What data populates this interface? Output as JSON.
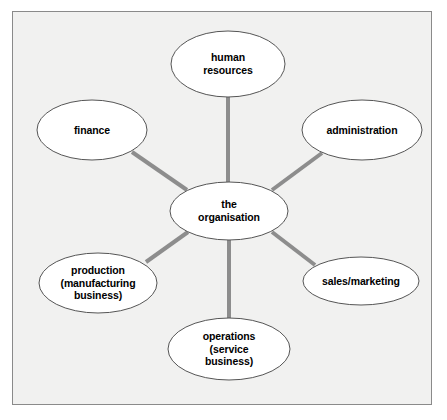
{
  "diagram": {
    "type": "hub-and-spoke concept map",
    "frame": {
      "background_color": "#f1f1f0",
      "border_color": "#8a8a8a"
    },
    "style": {
      "node_fill": "#ffffff",
      "node_stroke": "#555555",
      "connector_color": "#8d8d8d",
      "text_color": "#000000"
    },
    "center": {
      "id": "the-organisation",
      "label": "the\norganisation",
      "cx": 229,
      "cy": 211,
      "rx": 59,
      "ry": 29
    },
    "nodes": [
      {
        "id": "human-resources",
        "label": "human\nresources",
        "cx": 228,
        "cy": 64,
        "rx": 57,
        "ry": 33
      },
      {
        "id": "finance",
        "label": "finance",
        "cx": 92,
        "cy": 130,
        "rx": 55,
        "ry": 30
      },
      {
        "id": "administration",
        "label": "administration",
        "cx": 362,
        "cy": 130,
        "rx": 60,
        "ry": 30
      },
      {
        "id": "production",
        "label": "production\n(manufacturing\nbusiness)",
        "cx": 98,
        "cy": 283,
        "rx": 59,
        "ry": 30
      },
      {
        "id": "sales-marketing",
        "label": "sales/marketing",
        "cx": 361,
        "cy": 281,
        "rx": 58,
        "ry": 24
      },
      {
        "id": "operations",
        "label": "operations\n(service\nbusiness)",
        "cx": 229,
        "cy": 349,
        "rx": 61,
        "ry": 31
      }
    ],
    "connectors": [
      {
        "id": "center-to-human-resources",
        "from": "the-organisation",
        "to": "human-resources",
        "x1": 228,
        "y1": 182,
        "x2": 228,
        "y2": 97
      },
      {
        "id": "center-to-finance",
        "from": "the-organisation",
        "to": "finance",
        "x1": 187,
        "y1": 190,
        "x2": 132,
        "y2": 152
      },
      {
        "id": "center-to-administration",
        "from": "the-organisation",
        "to": "administration",
        "x1": 272,
        "y1": 190,
        "x2": 322,
        "y2": 153
      },
      {
        "id": "center-to-production",
        "from": "the-organisation",
        "to": "production",
        "x1": 188,
        "y1": 232,
        "x2": 146,
        "y2": 262
      },
      {
        "id": "center-to-sales-marketing",
        "from": "the-organisation",
        "to": "sales-marketing",
        "x1": 272,
        "y1": 232,
        "x2": 315,
        "y2": 265
      },
      {
        "id": "center-to-operations",
        "from": "the-organisation",
        "to": "operations",
        "x1": 229,
        "y1": 240,
        "x2": 229,
        "y2": 319
      }
    ]
  }
}
